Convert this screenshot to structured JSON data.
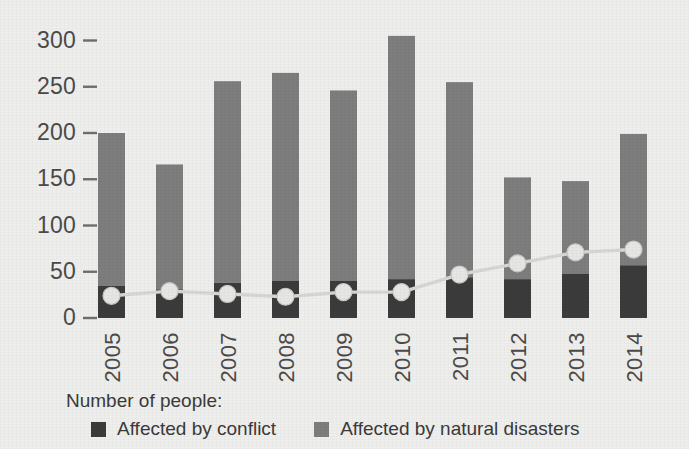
{
  "chart_data": {
    "type": "bar",
    "title": "",
    "subtitle": "",
    "xlabel": "",
    "ylabel": "",
    "categories": [
      "2005",
      "2006",
      "2007",
      "2008",
      "2009",
      "2010",
      "2011",
      "2012",
      "2013",
      "2014"
    ],
    "ylim": [
      0,
      320
    ],
    "yticks": [
      0,
      50,
      100,
      150,
      200,
      250,
      300
    ],
    "ytick_labels": [
      "0",
      "50",
      "100",
      "150",
      "200",
      "250",
      "300"
    ],
    "grid": false,
    "stacked": true,
    "legend_position": "bottom-left",
    "series": [
      {
        "name": "Affected by conflict",
        "type": "bar",
        "color": "#3b3b3b",
        "values": [
          35,
          31,
          38,
          40,
          40,
          42,
          44,
          42,
          48,
          57
        ]
      },
      {
        "name": "Affected by natural disasters",
        "type": "bar",
        "color": "#7d7d7d",
        "values": [
          165,
          135,
          218,
          225,
          206,
          263,
          211,
          110,
          100,
          142
        ]
      },
      {
        "name": "trend-line",
        "type": "line",
        "color": "#d6d6d4",
        "marker": "circle",
        "values": [
          24,
          29,
          26,
          23,
          28,
          28,
          47,
          59,
          71,
          74
        ]
      }
    ],
    "totals": [
      200,
      166,
      256,
      265,
      246,
      305,
      255,
      152,
      148,
      199
    ]
  },
  "legend": {
    "title": "Number of people:",
    "entries": [
      {
        "label": "Affected by conflict",
        "color": "#3b3b3b"
      },
      {
        "label": "Affected by natural disasters",
        "color": "#7d7d7d"
      }
    ]
  },
  "colors": {
    "background": "#eeeeec",
    "conflict": "#3b3b3b",
    "disaster": "#7d7d7d",
    "line": "#d6d6d4",
    "marker_fill": "#e6e6e4",
    "text": "#3a3a3a",
    "tick": "#6e6e6e"
  },
  "geometry": {
    "plot_left": 98,
    "plot_baseline_y": 318,
    "px_per_unit": 0.925,
    "bar_width": 27,
    "bar_pitch": 58,
    "tick_label_x": 76,
    "tick_mark_x1": 83,
    "tick_mark_x2": 97,
    "cat_label_baseline_y": 332
  }
}
